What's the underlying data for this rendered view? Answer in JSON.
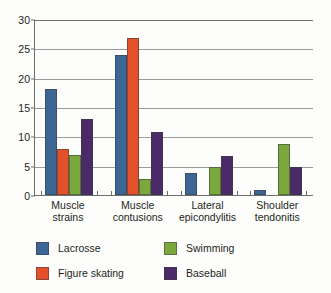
{
  "chart_data": {
    "type": "bar",
    "title": "",
    "subtitle": "",
    "xlabel": "",
    "ylabel": "",
    "ylim": [
      0,
      30
    ],
    "yticks": [
      0,
      5,
      10,
      15,
      20,
      25,
      30
    ],
    "grid": true,
    "legend_position": "bottom",
    "categories": [
      "Muscle strains",
      "Muscle contusions",
      "Lateral epicondylitis",
      "Shoulder tendonitis"
    ],
    "category_lines": [
      [
        "Muscle",
        "strains"
      ],
      [
        "Muscle",
        "contusions"
      ],
      [
        "Lateral",
        "epicondylitis"
      ],
      [
        "Shoulder",
        "tendonitis"
      ]
    ],
    "series": [
      {
        "name": "Lacrosse",
        "color": "#3d6694",
        "values": [
          18.0,
          23.8,
          3.8,
          0.8
        ]
      },
      {
        "name": "Figure skating",
        "color": "#e2512a",
        "values": [
          7.8,
          26.7,
          0,
          0
        ]
      },
      {
        "name": "Swimming",
        "color": "#7aa83c",
        "values": [
          6.9,
          2.8,
          4.8,
          8.7
        ]
      },
      {
        "name": "Baseball",
        "color": "#4b2a68",
        "values": [
          12.9,
          10.7,
          6.7,
          4.7
        ]
      }
    ]
  },
  "legend": {
    "items": [
      {
        "label": "Lacrosse",
        "color": "#3d6694"
      },
      {
        "label": "Swimming",
        "color": "#7aa83c"
      },
      {
        "label": "Figure skating",
        "color": "#e2512a"
      },
      {
        "label": "Baseball",
        "color": "#4b2a68"
      }
    ]
  }
}
